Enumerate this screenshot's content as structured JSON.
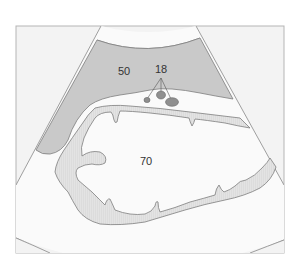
{
  "diagram": {
    "type": "ultrasound-schematic",
    "colors": {
      "frame_bg": "#f3f3f3",
      "frame_border": "#b5b5b5",
      "fan_bg": "#fafafa",
      "dark_region": "#c9c9c9",
      "wall_region": "#dedede",
      "nodes": "#8f8f8f",
      "outline": "#7d7d7d",
      "text": "#333333"
    },
    "labels": [
      {
        "id": "50",
        "text": "50",
        "x": 124,
        "y": 71
      },
      {
        "id": "18",
        "text": "18",
        "x": 161,
        "y": 69
      },
      {
        "id": "70",
        "text": "70",
        "x": 146,
        "y": 161
      }
    ]
  }
}
